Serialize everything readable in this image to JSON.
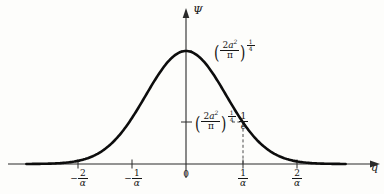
{
  "figure": {
    "type": "gaussian-wave-function-plot",
    "axes": {
      "y_label": "Ψ",
      "x_label": "q",
      "y_axis_x_px": 186,
      "x_axis_y_px": 164
    },
    "x_ticks": [
      {
        "name": "minus-two-over-alpha",
        "sign": "−",
        "num": "2",
        "den": "α",
        "x_px": 78
      },
      {
        "name": "minus-one-over-alpha",
        "sign": "−",
        "num": "1",
        "den": "α",
        "x_px": 132
      },
      {
        "name": "zero",
        "sign": "",
        "num": "0",
        "den": "",
        "x_px": 186
      },
      {
        "name": "one-over-alpha",
        "sign": "",
        "num": "1",
        "den": "α",
        "x_px": 243
      },
      {
        "name": "two-over-alpha",
        "sign": "",
        "num": "2",
        "den": "α",
        "x_px": 297
      }
    ],
    "annotations": {
      "peak": {
        "name": "peak-amplitude-label",
        "text": "(2a²/π)^(1/4)",
        "coefficient": "2",
        "variable": "a",
        "variable_exponent": "2",
        "denominator": "π",
        "outer_exponent_num": "1",
        "outer_exponent_den": "4",
        "tail": "",
        "y_px": 51
      },
      "one_over_e": {
        "name": "one-over-e-amplitude-label",
        "text": "(2a²/π)^(1/4) · 1/e",
        "coefficient": "2",
        "variable": "a",
        "variable_exponent": "2",
        "denominator": "π",
        "outer_exponent_num": "1",
        "outer_exponent_den": "4",
        "tail_num": "1",
        "tail_den": "e",
        "y_px": 122
      }
    },
    "chart_data": {
      "type": "line",
      "title": "",
      "xlabel": "q",
      "ylabel": "Ψ",
      "grid": false,
      "legend": null,
      "curve_name": "gaussian-psi",
      "function": "Psi(q) = (2a^2/pi)^(1/4) * exp(-a^2 q^2)",
      "xlim": [
        -2.8,
        2.8
      ],
      "ylim": [
        0,
        1.08
      ],
      "x_tick_values": [
        -2,
        -1,
        0,
        1,
        2
      ],
      "x_tick_labels": [
        "-2/α",
        "-1/α",
        "0",
        "1/α",
        "2/α"
      ],
      "y_marked_values": [
        1,
        0.3679
      ],
      "y_marked_labels": [
        "(2a²/π)^(1/4)",
        "(2a²/π)^(1/4) · 1/e"
      ],
      "x": [
        -2.8,
        -2.6,
        -2.4,
        -2.2,
        -2.0,
        -1.8,
        -1.6,
        -1.4,
        -1.2,
        -1.0,
        -0.8,
        -0.6,
        -0.4,
        -0.2,
        0.0,
        0.2,
        0.4,
        0.6,
        0.8,
        1.0,
        1.2,
        1.4,
        1.6,
        1.8,
        2.0,
        2.2,
        2.4,
        2.6,
        2.8
      ],
      "y": [
        0.0004,
        0.0012,
        0.0032,
        0.0079,
        0.0183,
        0.0392,
        0.0773,
        0.1409,
        0.2369,
        0.3679,
        0.5273,
        0.6977,
        0.8521,
        0.9608,
        1.0,
        0.9608,
        0.8521,
        0.6977,
        0.5273,
        0.3679,
        0.2369,
        0.1409,
        0.0773,
        0.0392,
        0.0183,
        0.0079,
        0.0032,
        0.0012,
        0.0004
      ],
      "dashed_guide": {
        "x": 1.0,
        "y": 0.3679,
        "label": "1/α at 1/e height"
      }
    }
  }
}
